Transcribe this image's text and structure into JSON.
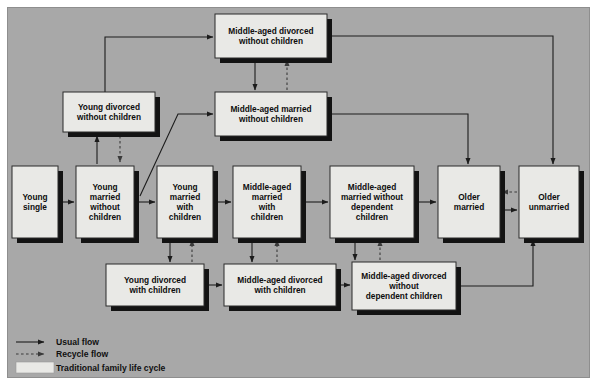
{
  "diagram": {
    "title": "Family Life Cycle",
    "background_color": "#a8a8a8",
    "box_fill_color": "#e9e9e6",
    "shadow_color": "#131313",
    "line_color": "#1c1c1c"
  },
  "nodes": [
    {
      "id": "mad-wo-children",
      "label_lines": [
        "Middle-aged divorced",
        "without children"
      ],
      "x": 215,
      "y": 14,
      "w": 112,
      "h": 44
    },
    {
      "id": "yd-wo-children",
      "label_lines": [
        "Young divorced",
        "without children"
      ],
      "x": 63,
      "y": 92,
      "w": 92,
      "h": 40
    },
    {
      "id": "mam-wo-children",
      "label_lines": [
        "Middle-aged married",
        "without children"
      ],
      "x": 215,
      "y": 92,
      "w": 112,
      "h": 44
    },
    {
      "id": "young-single",
      "label_lines": [
        "Young",
        "single"
      ],
      "x": 12,
      "y": 166,
      "w": 46,
      "h": 72
    },
    {
      "id": "ym-wo-children",
      "label_lines": [
        "Young",
        "married",
        "without",
        "children"
      ],
      "x": 76,
      "y": 166,
      "w": 58,
      "h": 72
    },
    {
      "id": "ym-w-children",
      "label_lines": [
        "Young",
        "married",
        "with",
        "children"
      ],
      "x": 157,
      "y": 166,
      "w": 56,
      "h": 72
    },
    {
      "id": "mam-w-children",
      "label_lines": [
        "Middle-aged",
        "married",
        "with",
        "children"
      ],
      "x": 233,
      "y": 166,
      "w": 68,
      "h": 72
    },
    {
      "id": "mam-wo-dep",
      "label_lines": [
        "Middle-aged",
        "married without",
        "dependent",
        "children"
      ],
      "x": 330,
      "y": 166,
      "w": 84,
      "h": 72
    },
    {
      "id": "older-married",
      "label_lines": [
        "Older",
        "married"
      ],
      "x": 438,
      "y": 166,
      "w": 62,
      "h": 72
    },
    {
      "id": "older-unmarried",
      "label_lines": [
        "Older",
        "unmarried"
      ],
      "x": 519,
      "y": 166,
      "w": 60,
      "h": 72
    },
    {
      "id": "yd-w-children",
      "label_lines": [
        "Young divorced",
        "with children"
      ],
      "x": 106,
      "y": 264,
      "w": 98,
      "h": 42
    },
    {
      "id": "mad-w-children",
      "label_lines": [
        "Middle-aged divorced",
        "with children"
      ],
      "x": 224,
      "y": 264,
      "w": 112,
      "h": 42
    },
    {
      "id": "mad-wo-dep",
      "label_lines": [
        "Middle-aged divorced",
        "without",
        "dependent children"
      ],
      "x": 352,
      "y": 262,
      "w": 104,
      "h": 48
    }
  ],
  "legend": {
    "items": [
      {
        "id": "usual-flow",
        "label": "Usual flow",
        "marker": "solid-arrow"
      },
      {
        "id": "recycle-flow",
        "label": "Recycle flow",
        "marker": "dashed-arrow"
      },
      {
        "id": "traditional",
        "label": "Traditional family life cycle",
        "marker": "swatch"
      }
    ]
  }
}
